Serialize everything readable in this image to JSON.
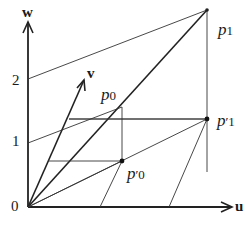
{
  "diagram": {
    "axes": {
      "u_label": "u",
      "w_label": "w",
      "v_label": "v"
    },
    "ticks": [
      {
        "label": "0",
        "value": 0
      },
      {
        "label": "1",
        "value": 1
      },
      {
        "label": "2",
        "value": 2
      }
    ],
    "points": {
      "p0": {
        "base": "p",
        "sub": "0",
        "prime": ""
      },
      "p1": {
        "base": "p",
        "sub": "1",
        "prime": ""
      },
      "p0_prime": {
        "base": "p",
        "sub": "0",
        "prime": "′"
      },
      "p1_prime": {
        "base": "p",
        "sub": "1",
        "prime": "′"
      }
    },
    "colors": {
      "line": "#222222",
      "thin": "#333333",
      "background": "#ffffff"
    }
  }
}
